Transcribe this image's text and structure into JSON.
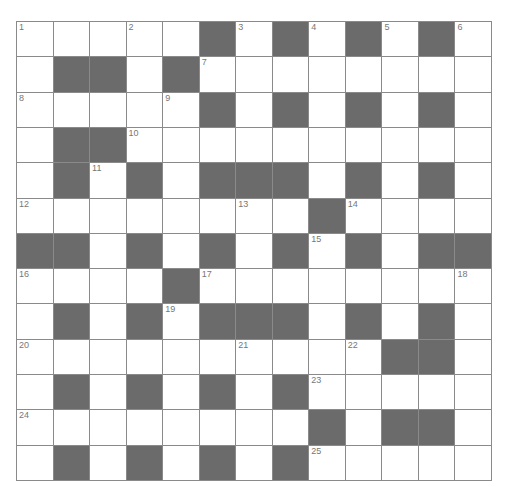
{
  "puzzle": {
    "type": "crossword",
    "rows": 13,
    "cols": 13,
    "colors": {
      "black": "#6b6b6b",
      "white": "#ffffff",
      "line": "#8a8a8a",
      "number": "#777777"
    },
    "layout": [
      "WWWWWBWBWBWBW",
      "WBBWBWWWWWWWW",
      "WWWWWBWBWBWBW",
      "WBBWWWWWWWWWW",
      "WBWBWBBBWBWBW",
      "WWWWWWWWBWWWW",
      "BBWBWBWBWBWBB",
      "WWWWBWWWWWWWW",
      "WBWBWBBBWBWBW",
      "WWWWWWWWWWBBW",
      "WBWBWBWBWWWWW",
      "WWWWWWWWBWBBW",
      "WBWBWBWBWWWWW"
    ],
    "numbers": [
      {
        "r": 0,
        "c": 0,
        "n": "1"
      },
      {
        "r": 0,
        "c": 3,
        "n": "2"
      },
      {
        "r": 0,
        "c": 6,
        "n": "3"
      },
      {
        "r": 0,
        "c": 8,
        "n": "4"
      },
      {
        "r": 0,
        "c": 10,
        "n": "5"
      },
      {
        "r": 0,
        "c": 12,
        "n": "6"
      },
      {
        "r": 1,
        "c": 5,
        "n": "7"
      },
      {
        "r": 2,
        "c": 0,
        "n": "8"
      },
      {
        "r": 2,
        "c": 4,
        "n": "9"
      },
      {
        "r": 3,
        "c": 3,
        "n": "10"
      },
      {
        "r": 4,
        "c": 2,
        "n": "11"
      },
      {
        "r": 5,
        "c": 0,
        "n": "12"
      },
      {
        "r": 5,
        "c": 6,
        "n": "13"
      },
      {
        "r": 5,
        "c": 9,
        "n": "14"
      },
      {
        "r": 6,
        "c": 8,
        "n": "15"
      },
      {
        "r": 7,
        "c": 0,
        "n": "16"
      },
      {
        "r": 7,
        "c": 5,
        "n": "17"
      },
      {
        "r": 7,
        "c": 12,
        "n": "18"
      },
      {
        "r": 8,
        "c": 4,
        "n": "19"
      },
      {
        "r": 9,
        "c": 0,
        "n": "20"
      },
      {
        "r": 9,
        "c": 6,
        "n": "21"
      },
      {
        "r": 9,
        "c": 9,
        "n": "22"
      },
      {
        "r": 10,
        "c": 8,
        "n": "23"
      },
      {
        "r": 11,
        "c": 0,
        "n": "24"
      },
      {
        "r": 12,
        "c": 8,
        "n": "25"
      }
    ]
  }
}
